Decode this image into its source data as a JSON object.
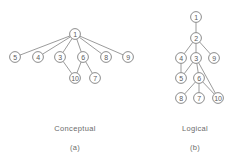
{
  "figure": {
    "title": "",
    "panels": [
      {
        "key": "conceptual",
        "caption": "Conceptual",
        "sublabel": "(a)",
        "nodes": [
          {
            "id": "1",
            "label": "1",
            "x": 75,
            "y": 34
          },
          {
            "id": "5",
            "label": "5",
            "x": 15,
            "y": 57
          },
          {
            "id": "4",
            "label": "4",
            "x": 38,
            "y": 57
          },
          {
            "id": "3",
            "label": "3",
            "x": 60,
            "y": 57
          },
          {
            "id": "6",
            "label": "6",
            "x": 83,
            "y": 57
          },
          {
            "id": "8",
            "label": "8",
            "x": 106,
            "y": 57
          },
          {
            "id": "9",
            "label": "9",
            "x": 128,
            "y": 57
          },
          {
            "id": "10",
            "label": "10",
            "x": 75,
            "y": 78
          },
          {
            "id": "7",
            "label": "7",
            "x": 95,
            "y": 78
          }
        ],
        "edges": [
          {
            "from": "1",
            "to": "5"
          },
          {
            "from": "1",
            "to": "4"
          },
          {
            "from": "1",
            "to": "3"
          },
          {
            "from": "1",
            "to": "6"
          },
          {
            "from": "1",
            "to": "8"
          },
          {
            "from": "1",
            "to": "9"
          },
          {
            "from": "3",
            "to": "10"
          },
          {
            "from": "6",
            "to": "10"
          },
          {
            "from": "6",
            "to": "7"
          }
        ]
      },
      {
        "key": "logical",
        "caption": "Logical",
        "sublabel": "(b)",
        "nodes": [
          {
            "id": "1",
            "label": "1",
            "x": 196,
            "y": 17
          },
          {
            "id": "2",
            "label": "2",
            "x": 196,
            "y": 38
          },
          {
            "id": "4",
            "label": "4",
            "x": 181,
            "y": 58
          },
          {
            "id": "3",
            "label": "3",
            "x": 196,
            "y": 58
          },
          {
            "id": "9",
            "label": "9",
            "x": 214,
            "y": 58
          },
          {
            "id": "5",
            "label": "5",
            "x": 181,
            "y": 78
          },
          {
            "id": "6",
            "label": "6",
            "x": 199,
            "y": 78
          },
          {
            "id": "8",
            "label": "8",
            "x": 181,
            "y": 98
          },
          {
            "id": "7",
            "label": "7",
            "x": 199,
            "y": 98
          },
          {
            "id": "10",
            "label": "10",
            "x": 218,
            "y": 98
          }
        ],
        "edges": [
          {
            "from": "1",
            "to": "2"
          },
          {
            "from": "2",
            "to": "4"
          },
          {
            "from": "2",
            "to": "3"
          },
          {
            "from": "2",
            "to": "9"
          },
          {
            "from": "3",
            "to": "5"
          },
          {
            "from": "4",
            "to": "5"
          },
          {
            "from": "3",
            "to": "6"
          },
          {
            "from": "3",
            "to": "10"
          },
          {
            "from": "6",
            "to": "8"
          },
          {
            "from": "6",
            "to": "7"
          },
          {
            "from": "6",
            "to": "10"
          }
        ]
      }
    ],
    "style": {
      "node_radius": 5.4,
      "node_fill": "#ffffff",
      "node_stroke": "#6e6e6e",
      "edge_stroke": "#707070",
      "text_color": "#5d5d5d",
      "background": "#ffffff"
    }
  }
}
